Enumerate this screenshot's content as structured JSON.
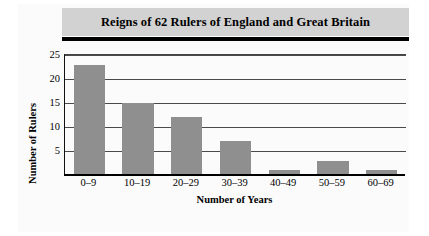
{
  "chart_data": {
    "type": "bar",
    "title": "Reigns of 62 Rulers of England and Great Britain",
    "categories": [
      "0–9",
      "10–19",
      "20–29",
      "30–39",
      "40–49",
      "50–59",
      "60–69"
    ],
    "values": [
      23,
      15,
      12,
      7,
      1,
      3,
      1
    ],
    "xlabel": "Number of Years",
    "ylabel": "Number of Rulers",
    "ylim": [
      0,
      25
    ],
    "yticks": [
      5,
      10,
      15,
      20,
      25
    ],
    "grid": true,
    "legend": "none",
    "bar_color": "#8f8f8f",
    "title_band_color": "#d2d2d2",
    "axis_color": "#000000"
  }
}
